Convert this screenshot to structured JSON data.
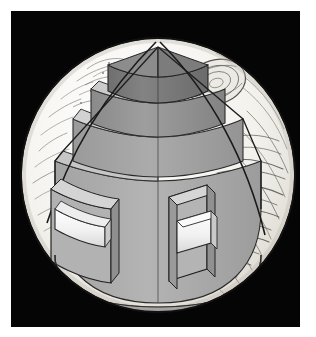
{
  "figure": {
    "style": "grayscale engraving / line-art cutaway diagram",
    "background_color": "#050505",
    "page_color": "#ffffff",
    "canvas": {
      "width": 316,
      "height": 337
    },
    "panel": {
      "left": 11,
      "top": 11,
      "width": 289,
      "height": 316
    }
  },
  "planet": {
    "name": "Jupiter",
    "center": {
      "x": 158,
      "y": 175
    },
    "radius": 137,
    "surface_fill": "#f2f1ec",
    "surface_shadow_fill": "#dedbd4",
    "outline_color": "#1a1a1a",
    "cloud_band_color": "#55524c",
    "great_red_spot": {
      "label": "Great Red Spot",
      "center": {
        "x": 216,
        "y": 82
      },
      "rx": 30,
      "ry": 22,
      "rotation_deg": -18
    }
  },
  "cutaway": {
    "label": "Quarter-wedge cutaway revealing interior layers",
    "apex": {
      "x": 156,
      "y": 49
    },
    "left_limb": {
      "x": 40,
      "y": 223
    },
    "right_limb": {
      "x": 232,
      "y": 259
    },
    "edge_color": "#1f1f1f"
  },
  "layers": [
    {
      "index": 0,
      "name": "core",
      "label": "Rocky core",
      "top_fill": "#8e8e8e",
      "side_fill": "#7e7e7e",
      "rim_fill": "#cfcfcf"
    },
    {
      "index": 1,
      "name": "metallic-hydrogen",
      "label": "Liquid metallic hydrogen",
      "top_fill": "#9d9d9d",
      "side_fill": "#8b8b8b",
      "rim_fill": "#d7d7d7"
    },
    {
      "index": 2,
      "name": "liquid-hydrogen",
      "label": "Liquid molecular hydrogen",
      "top_fill": "#a8a8a8",
      "side_fill": "#979797",
      "rim_fill": "#e0e0e0"
    },
    {
      "index": 3,
      "name": "atmosphere",
      "label": "Gaseous atmosphere",
      "top_fill": "#b3b3b3",
      "side_fill": "#a2a2a2",
      "rim_fill": "#ececec"
    }
  ],
  "callout_blocks": [
    {
      "id": "left",
      "name": "left-callout-block",
      "label": "Left layer detail block",
      "face_fill": "#b0b0b0",
      "top_fill": "#d2d2d2",
      "edge_fill": "#8f8f8f",
      "plate_fill": "#f4f4f4"
    },
    {
      "id": "right",
      "name": "right-callout-block",
      "label": "Right layer detail block",
      "face_fill": "#b0b0b0",
      "top_fill": "#d2d2d2",
      "edge_fill": "#8f8f8f",
      "plate_fill": "#f4f4f4"
    }
  ],
  "palette": {
    "black": "#050505",
    "white": "#ffffff",
    "outline": "#1a1a1a",
    "light_gray": "#f2f1ec",
    "mid_gray": "#a8a8a8",
    "dark_gray": "#7e7e7e"
  }
}
